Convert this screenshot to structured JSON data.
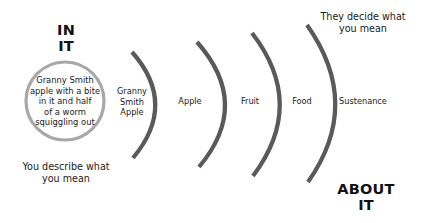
{
  "diagram": {
    "type": "concentric-abstraction-levels",
    "colors": {
      "background": "#ffffff",
      "arc": "#5a5a5a",
      "core_circle_stroke": "#a8a8a8",
      "text": "#1a1a1a"
    },
    "top_left_heading": {
      "line1": "IN",
      "line2": "IT"
    },
    "bottom_right_heading": {
      "line1": "ABOUT",
      "line2": "IT"
    },
    "top_right_caption": {
      "line1": "They decide what",
      "line2": "you mean"
    },
    "bottom_left_caption": {
      "line1": "You describe what",
      "line2": "you mean"
    },
    "core": {
      "lines": [
        "Granny Smith",
        "apple with a bite",
        "in it and half",
        "of a worm",
        "squiggling out"
      ]
    },
    "levels": [
      {
        "lines": [
          "Granny",
          "Smith",
          "Apple"
        ]
      },
      {
        "lines": [
          "Apple"
        ]
      },
      {
        "lines": [
          "Fruit"
        ]
      },
      {
        "lines": [
          "Food"
        ]
      },
      {
        "lines": [
          "Sustenance"
        ]
      }
    ]
  }
}
